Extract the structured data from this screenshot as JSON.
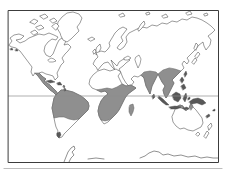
{
  "map": {
    "kind": "world-distribution-map",
    "depicts": {
      "description": "Hand-drawn world outline map with gray shaded pantropical distribution and equator line",
      "shaded_distribution_regions": [
        "Central America and Caribbean islands",
        "Tropical South America",
        "Sub-Saharan Africa",
        "Madagascar",
        "Indian subcontinent and Sri Lanka",
        "Southeast Asia and southern China",
        "Philippines, Indonesia and New Guinea",
        "Northern Australia",
        "New Caledonia and Fiji"
      ],
      "unshaded_landmasses": [
        "North America",
        "Greenland",
        "Europe",
        "Northern Asia",
        "Arabia",
        "Sahara and North Africa",
        "Southern South America",
        "Cape of southern Africa",
        "Japan",
        "Most of Australia",
        "New Zealand",
        "Antarctica coast"
      ],
      "gridlines": [
        "equator"
      ]
    },
    "colors": {
      "background": "#ffffff",
      "outline": "#474747",
      "frame": "#3c3c3c",
      "equator": "#8c8c8c",
      "shade": "#8f8f8f",
      "dark_islands": "#585858",
      "page_edge": "#bdbdbd"
    },
    "styles": {
      "land": {
        "fill": "#ffffff",
        "stroke": "#474747",
        "sw": 0.55
      },
      "water": {
        "fill": "#ffffff",
        "stroke": "#474747",
        "sw": 0.5
      },
      "shade": {
        "fill": "#8f8f8f",
        "stroke": "#606060",
        "sw": 0.5
      },
      "dark": {
        "fill": "#585858",
        "stroke": "#474747",
        "sw": 0.4
      },
      "coast": {
        "fill": "none",
        "stroke": "#474747",
        "sw": 0.6
      },
      "grid": {
        "fill": "none",
        "stroke": "#8c8c8c",
        "sw": 0.7
      },
      "frame": {
        "fill": "none",
        "stroke": "#3c3c3c",
        "sw": 1
      },
      "edge": {
        "fill": "none",
        "stroke": "#bdbdbd",
        "sw": 1.2
      }
    },
    "frame_rect": {
      "x": 8.5,
      "y": 10.5,
      "w": 210,
      "h": 152
    },
    "equator_y": 96,
    "shapes": [
      {
        "name": "landmass-north-america",
        "style": "land",
        "d": "M9,45 L12,41 L10,38 L14,35 L19,34 L24,36 L21,39 L16,40 L20,43 L25,41 L29,38 L34,36 L39,34 L44,35 L49,33 L54,35 L58,37 L56,40 L52,39 L48,42 L45,46 L44,51 L46,55 L50,57 L53,54 L55,49 L57,44 L59,40 L62,38 L66,41 L64,45 L68,44 L71,47 L68,51 L65,54 L62,58 L64,62 L61,65 L59,69 L57,73 L58,77 L55,80 L53,76 L50,75 L46,74 L42,72 L39,73 L43,77 L46,79 L44,81 L47,83 L50,85 L53,88 L56,91 L58,94 L56,95 L53,92 L50,90 L47,87 L44,84 L41,80 L38,76 L35,73 L33,76 L31,72 L32,67 L29,63 L26,59 L23,55 L20,51 L16,48 L12,47 Z"
      },
      {
        "name": "landmass-greenland",
        "style": "land",
        "d": "M60,33 L57,28 L58,22 L62,17 L67,13 L73,12 L79,14 L82,18 L80,23 L77,27 L79,31 L75,35 L71,39 L67,42 L63,40 L61,36 Z"
      },
      {
        "name": "canadian-arctic-islands",
        "style": "land",
        "d": "M30,22 L34,19 L38,21 L35,24 Z M40,16 L45,14 L48,17 L44,19 Z M50,20 L54,18 L57,21 L53,23 Z M36,27 L41,25 L44,28 L39,30 Z M52,26 L56,23 L59,26 L56,30 Z M31,32 L35,30 L38,33 L34,35 Z"
      },
      {
        "name": "landmass-iceland",
        "style": "land",
        "d": "M88,39 L92,37 L95,39 L91,41 Z"
      },
      {
        "name": "landmass-great-britain",
        "style": "land",
        "d": "M97,47 L100,44 L101,48 L99,52 L96,55 L96,50 Z"
      },
      {
        "name": "landmass-ireland",
        "style": "land",
        "d": "M93,51 L95,49 L96,52 L94,54 Z"
      },
      {
        "name": "landmass-eurasia",
        "style": "land",
        "d": "M96,67 L93,64 L95,60 L98,57 L96,53 L101,51 L105,52 L108,49 L110,46 L109,43 L112,38 L115,33 L119,29 L123,27 L127,29 L124,33 L121,37 L123,41 L119,45 L117,48 L120,50 L124,47 L127,42 L126,37 L129,33 L133,31 L137,29 L142,27 L147,28 L152,25 L157,26 L162,23 L167,24 L172,21 L177,22 L182,19 L187,20 L192,17 L197,18 L202,20 L207,23 L211,26 L215,30 L212,33 L208,36 L211,40 L210,45 L206,50 L204,46 L203,42 L199,45 L195,50 L191,54 L187,58 L189,61 L187,64 L184,61 L182,64 L184,68 L181,71 L178,74 L175,77 L172,80 L174,83 L172,87 L170,91 L168,95 L166,98 L164,94 L163,90 L165,86 L162,82 L160,78 L158,74 L156,78 L154,82 L152,86 L151,90 L150,94 L148,90 L146,86 L145,82 L144,78 L141,75 L138,77 L134,76 L131,79 L134,82 L130,87 L126,83 L123,78 L121,73 L119,69 L123,66 L126,63 L130,60 L126,58 L122,60 L119,62 L117,66 L114,63 L111,60 L113,65 L115,70 L112,67 L108,62 L104,63 L101,66 L98,70 Z"
      },
      {
        "name": "landmass-africa",
        "style": "land",
        "d": "M98,71 L104,69 L110,71 L116,69 L121,72 L118,76 L120,80 L122,84 L126,86 L131,85 L136,88 L132,91 L128,94 L125,98 L123,102 L121,106 L119,110 L116,114 L112,118 L108,122 L104,124 L101,120 L99,116 L98,111 L99,106 L101,101 L104,97 L108,94 L105,91 L101,92 L97,90 L92,88 L89,84 L90,79 L93,75 Z"
      },
      {
        "name": "landmass-south-america",
        "style": "land",
        "d": "M58,93 L61,90 L65,90 L69,91 L73,92 L77,94 L81,96 L85,99 L88,102 L89,106 L88,110 L85,113 L82,116 L79,119 L76,122 L73,125 L70,128 L67,131 L64,134 L62,137 L59,138 L57,135 L58,131 L56,127 L55,123 L54,118 L53,113 L52,108 L53,103 L54,98 L56,95 Z"
      },
      {
        "name": "landmass-japan",
        "style": "land",
        "d": "M195,56 L198,52 L200,54 L197,58 Z M192,62 L195,58 L197,60 L194,64 Z"
      },
      {
        "name": "landmass-sakhalin",
        "style": "land",
        "d": "M194,48 L196,43 L198,45 L196,50 Z"
      },
      {
        "name": "landmass-australia",
        "style": "land",
        "d": "M174,112 L176,107 L180,105 L183,106 L184,109 L186,111 L189,108 L191,103 L193,107 L196,110 L199,114 L202,118 L203,123 L201,127 L197,129 L193,131 L188,130 L184,128 L180,129 L176,126 L173,122 L172,117 Z"
      },
      {
        "name": "landmass-tasmania",
        "style": "land",
        "d": "M196,134 L198,132 L200,134 L198,136 Z"
      },
      {
        "name": "landmass-new-zealand",
        "style": "land",
        "d": "M208,126 L211,123 L212,126 L209,130 Z M204,136 L207,131 L209,133 L206,138 Z"
      },
      {
        "name": "landmass-svalbard",
        "style": "land",
        "d": "M119,15 L123,13 L125,16 L121,17 Z"
      },
      {
        "name": "landmass-novaya-zemlya",
        "style": "land",
        "d": "M138,29 L141,24 L144,21 L145,24 L142,28 L139,31 Z"
      },
      {
        "name": "landmass-franz-josef-land",
        "style": "land",
        "d": "M146,13 L149,12 L150,14 L147,15 Z"
      },
      {
        "name": "landmass-severnaya-zemlya",
        "style": "land",
        "d": "M162,16 L166,14 L168,17 L164,18 Z"
      },
      {
        "name": "landmass-new-siberian-islands",
        "style": "land",
        "d": "M186,13 L190,11 L192,14 L188,15 Z"
      },
      {
        "name": "landmass-wrangel-island",
        "style": "land",
        "d": "M204,14 L207,13 L208,15 L205,16 Z"
      },
      {
        "name": "caspian-sea",
        "style": "water",
        "d": "M136,57 L139,55 L141,59 L140,64 L138,68 L136,63 L135,60 Z"
      },
      {
        "name": "black-sea",
        "style": "water",
        "d": "M124,58 L128,56 L131,58 L128,60 L125,60 Z"
      },
      {
        "name": "great-lakes",
        "style": "water",
        "d": "M48,60 L51,58 L54,59 L56,61 L53,62 L50,62 Z"
      },
      {
        "name": "lake-victoria",
        "style": "water",
        "circle": {
          "cx": 120,
          "cy": 98,
          "r": 0.9
        }
      },
      {
        "name": "shade-central-america",
        "style": "shade",
        "d": "M35,73 L39,73 L43,77 L46,79 L44,81 L47,83 L50,85 L53,88 L56,91 L58,94 L56,95 L53,92 L50,90 L47,87 L44,84 L41,80 L38,76 Z"
      },
      {
        "name": "shade-tropical-south-america",
        "style": "shade",
        "d": "M58,93 L61,90 L65,90 L69,91 L73,92 L77,94 L81,96 L85,99 L88,102 L89,106 L88,110 L85,113 L82,116 L79,119 L74,120 L69,119 L64,117 L59,117 L54,118 L53,113 L52,108 L53,103 L54,98 L56,95 Z"
      },
      {
        "name": "shade-sub-saharan-africa",
        "style": "shade",
        "d": "M97,90 L101,92 L105,91 L108,94 L104,97 L101,101 L99,106 L98,111 L99,116 L101,120 L105,121 L109,120 L112,118 L116,114 L119,110 L121,106 L123,102 L125,98 L128,94 L132,91 L136,88 L131,85 L126,86 L122,84 L117,87 L112,89 L107,88 L102,89 Z"
      },
      {
        "name": "shade-india",
        "style": "shade",
        "d": "M141,75 L144,72 L150,71 L156,72 L158,74 L156,78 L154,82 L152,86 L151,90 L150,94 L148,90 L146,86 L145,82 L144,78 Z"
      },
      {
        "name": "shade-southeast-asia",
        "style": "shade",
        "d": "M175,69 L181,71 L178,74 L175,77 L172,80 L174,83 L172,87 L170,91 L168,95 L166,98 L164,94 L163,90 L165,86 L162,82 L160,78 L158,74 L163,70 L169,68 Z"
      },
      {
        "name": "shade-northern-australia",
        "style": "shade",
        "d": "M176,107 L180,105 L183,106 L184,109 L181,108 L178,108 Z M189,108 L191,103 L193,107 L191,110 Z"
      },
      {
        "name": "island-cuba",
        "style": "dark",
        "d": "M46,81 L51,80 L55,82 L50,83 Z"
      },
      {
        "name": "island-hispaniola",
        "style": "dark",
        "d": "M57,83 L60,82 L62,85 L58,85 Z"
      },
      {
        "name": "islands-lesser-antilles",
        "style": "dark",
        "d": "M63,86 L64,85 L65,87 L64,88 Z M64,89 L65,88 L66,90 L65,91 Z"
      },
      {
        "name": "south-america-tip-mark",
        "style": "dark",
        "d": "M57,133 L60,132 L61,135 L59,138 L57,136 Z"
      },
      {
        "name": "island-madagascar",
        "style": "shade",
        "d": "M130,105 L133,104 L134,108 L133,112 L131,116 L129,112 L129,108 Z"
      },
      {
        "name": "island-sri-lanka",
        "style": "dark",
        "d": "M152,96 L154,94 L155,97 L153,99 Z"
      },
      {
        "name": "island-taiwan",
        "style": "dark",
        "d": "M184,74 L186,71 L187,74 L185,77 Z"
      },
      {
        "name": "islands-philippines",
        "style": "dark",
        "d": "M180,80 L182,77 L184,80 L182,83 Z M181,86 L184,84 L186,88 L183,90 Z"
      },
      {
        "name": "island-sumatra",
        "style": "dark",
        "d": "M159,96 L163,99 L166,102 L169,105 L166,105 L162,102 L158,98 Z"
      },
      {
        "name": "island-java",
        "style": "dark",
        "d": "M169,107 L175,106 L181,107 L177,109 L171,109 Z"
      },
      {
        "name": "island-borneo",
        "style": "dark",
        "d": "M172,95 L176,92 L180,94 L181,98 L178,102 L174,100 Z"
      },
      {
        "name": "island-sulawesi",
        "style": "dark",
        "d": "M184,96 L186,93 L187,97 L185,102 L183,99 Z"
      },
      {
        "name": "islands-lesser-sunda",
        "style": "dark",
        "d": "M183,108 L187,107 L189,109 L185,110 Z"
      },
      {
        "name": "islands-moluccas",
        "style": "dark",
        "d": "M188,98 L190,97 L190,99 L188,100 Z"
      },
      {
        "name": "island-new-guinea",
        "style": "dark",
        "d": "M189,102 L193,99 L198,98 L203,100 L206,103 L202,105 L197,103 L192,104 Z"
      },
      {
        "name": "island-new-caledonia",
        "style": "dark",
        "d": "M206,116 L209,114 L210,116 L207,118 Z"
      },
      {
        "name": "island-fiji",
        "style": "dark",
        "d": "M213,110 L215,109 L215,111 L213,111 Z"
      },
      {
        "name": "islands-aleutians",
        "style": "dark",
        "d": "M10,49 L12,48 L13,50 L11,50 Z M15,50 L17,49 L18,51 L16,51 Z"
      },
      {
        "name": "antarctica-coastline",
        "style": "coast",
        "d": "M88,159 L96,158 L104,159 M140,158 L145,156 L149,153 L154,151 L159,152 L163,155 L168,154 L174,156 L181,155 L188,157 L195,156 L201,158 L207,157 L213,158 L218,158"
      },
      {
        "name": "antarctic-peninsula",
        "style": "coast",
        "d": "M64,162 L66,157 L68,152 L71,148 L74,146 L75,149 L72,152 L74,155 L71,158 L69,162"
      },
      {
        "name": "equator-line",
        "style": "grid",
        "line": {
          "x1": 8.5,
          "y1": 96,
          "x2": 218.5,
          "y2": 96
        }
      },
      {
        "name": "map-frame",
        "style": "frame",
        "rect": {
          "x": 8.5,
          "y": 10.5,
          "w": 210,
          "h": 152
        }
      },
      {
        "name": "page-bottom-edge",
        "style": "edge",
        "line": {
          "x1": 4,
          "y1": 168.5,
          "x2": 222,
          "y2": 168.5
        }
      }
    ]
  }
}
